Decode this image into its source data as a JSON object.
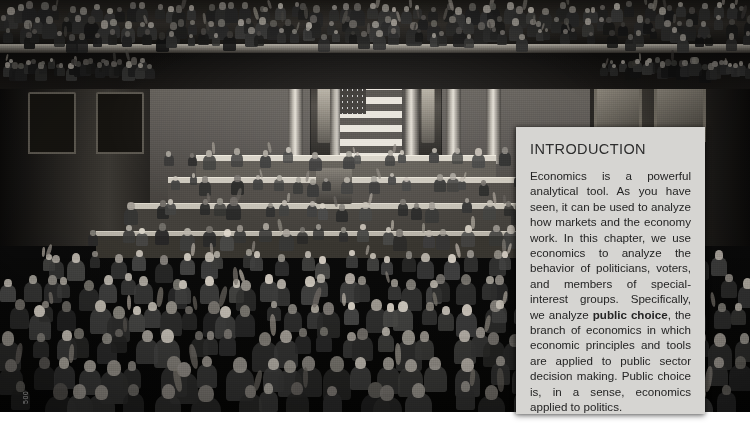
{
  "page": {
    "folio": "500"
  },
  "figure": {
    "name": "congress-chamber-photo",
    "caption_alt": "Joint session of the United States Congress in the House chamber, members standing and applauding"
  },
  "intro": {
    "heading": "INTRODUCTION",
    "body_part1": "Economics is a powerful analytical tool. As you have seen, it can be used to analyze how markets and the economy work. In this chapter, we use economics to analyze the behavior of politicians, voters, and members of special-interest groups. Specifically, we analyze ",
    "body_term": "public choice",
    "body_part2": ", the branch of economics in which economic principles and tools are applied to public sector decision making. Public choice is, in a sense, economics applied to politics.",
    "background_color": "#d6d5d2",
    "heading_color": "#2d2d2d",
    "text_color": "#242424"
  },
  "colors": {
    "photo_background": "#0a0a0a",
    "page_background": "#ffffff",
    "folio_color": "#7d7d7d"
  }
}
